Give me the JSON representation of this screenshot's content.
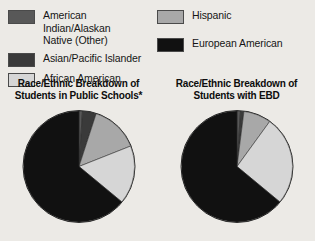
{
  "legend": {
    "columns": [
      {
        "items": [
          {
            "label": "American Indian/Alaskan\nNative (Other)",
            "color": "#585858",
            "key": "american-indian-alaskan-native"
          },
          {
            "label": "Asian/Pacific Islander",
            "color": "#3a3a3a",
            "key": "asian-pacific-islander"
          },
          {
            "label": "African American",
            "color": "#d6d6d6",
            "key": "african-american"
          }
        ]
      },
      {
        "items": [
          {
            "label": "Hispanic",
            "color": "#a8a8a8",
            "key": "hispanic"
          },
          {
            "label": "European American",
            "color": "#111111",
            "key": "european-american"
          }
        ]
      }
    ]
  },
  "charts": [
    {
      "id": "public-schools",
      "title": "Race/Ethnic Breakdown of\nStudents in Public Schools*"
    },
    {
      "id": "students-with-ebd",
      "title": "Race/Ethnic Breakdown of\nStudents with EBD"
    }
  ],
  "chart_data": [
    {
      "type": "pie",
      "title": "Race/Ethnic Breakdown of Students in Public Schools*",
      "labels": [
        "American Indian/Alaskan Native (Other)",
        "Asian/Pacific Islander",
        "Hispanic",
        "African American",
        "European American"
      ],
      "values": [
        1,
        4,
        14,
        17,
        64
      ],
      "unit": "percent",
      "colors": [
        "#585858",
        "#3a3a3a",
        "#a8a8a8",
        "#d6d6d6",
        "#111111"
      ],
      "start_angle_deg": 0,
      "direction": "clockwise",
      "legend": "top",
      "grid": false
    },
    {
      "type": "pie",
      "title": "Race/Ethnic Breakdown of Students with EBD",
      "labels": [
        "American Indian/Alaskan Native (Other)",
        "Asian/Pacific Islander",
        "Hispanic",
        "African American",
        "European American"
      ],
      "values": [
        1,
        1,
        8,
        26,
        64
      ],
      "unit": "percent",
      "colors": [
        "#585858",
        "#3a3a3a",
        "#a8a8a8",
        "#d6d6d6",
        "#111111"
      ],
      "start_angle_deg": 0,
      "direction": "clockwise",
      "legend": "top",
      "grid": false
    }
  ]
}
